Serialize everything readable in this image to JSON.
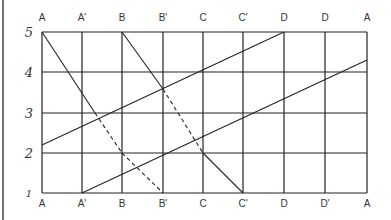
{
  "diagram": {
    "top_labels": [
      "A",
      "A'",
      "B",
      "B'",
      "C",
      "C'",
      "D",
      "D",
      "A"
    ],
    "bottom_labels": [
      "A",
      "A'",
      "B",
      "B'",
      "C",
      "C'",
      "D",
      "D'",
      "A"
    ],
    "y_labels": [
      "5",
      "4",
      "3",
      "2",
      "1"
    ],
    "x_positions": [
      42,
      82,
      122,
      163,
      203,
      243,
      284,
      325,
      367
    ],
    "y_positions": [
      32,
      72,
      113,
      153,
      193
    ],
    "line_color": "#222222",
    "solid_lines": [
      {
        "x1": 42,
        "y1": 32,
        "x2": 95,
        "y2": 113
      },
      {
        "x1": 122,
        "y1": 32,
        "x2": 163,
        "y2": 89
      },
      {
        "x1": 203,
        "y1": 153,
        "x2": 243,
        "y2": 193
      },
      {
        "x1": 42,
        "y1": 145,
        "x2": 284,
        "y2": 32
      },
      {
        "x1": 82,
        "y1": 193,
        "x2": 367,
        "y2": 60
      }
    ],
    "dashed_lines": [
      {
        "x1": 95,
        "y1": 113,
        "x2": 122,
        "y2": 153
      },
      {
        "x1": 163,
        "y1": 89,
        "x2": 203,
        "y2": 153
      },
      {
        "x1": 122,
        "y1": 153,
        "x2": 163,
        "y2": 193
      }
    ]
  }
}
